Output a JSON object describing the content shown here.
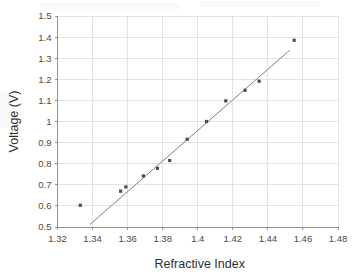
{
  "chart_data": {
    "type": "scatter",
    "title": "",
    "xlabel": "Refractive Index",
    "ylabel": "Voltage (V)",
    "xlim": [
      1.32,
      1.48
    ],
    "ylim": [
      0.5,
      1.5
    ],
    "xticks": [
      "1.32",
      "1.34",
      "1.36",
      "1.38",
      "1.4",
      "1.42",
      "1.44",
      "1.46",
      "1.48"
    ],
    "xtick_values": [
      1.32,
      1.34,
      1.36,
      1.38,
      1.4,
      1.42,
      1.44,
      1.46,
      1.48
    ],
    "yticks": [
      "0.5",
      "0.6",
      "0.7",
      "0.8",
      "0.9",
      "1",
      "1.1",
      "1.2",
      "1.3",
      "1.4",
      "1.5"
    ],
    "ytick_values": [
      0.5,
      0.6,
      0.7,
      0.8,
      0.9,
      1.0,
      1.1,
      1.2,
      1.3,
      1.4,
      1.5
    ],
    "grid": true,
    "legend": false,
    "legend_position": "none",
    "marker_color": "#4a4a5e",
    "trendline_color": "#6f6f83",
    "x": [
      1.333,
      1.356,
      1.359,
      1.369,
      1.377,
      1.384,
      1.394,
      1.405,
      1.416,
      1.427,
      1.435,
      1.455
    ],
    "y": [
      0.603,
      0.67,
      0.69,
      0.742,
      0.778,
      0.815,
      0.916,
      1.0,
      1.098,
      1.148,
      1.191,
      1.385
    ],
    "series": [
      {
        "name": "Voltage vs Refractive Index",
        "points": [
          {
            "x": 1.333,
            "y": 0.603
          },
          {
            "x": 1.356,
            "y": 0.67
          },
          {
            "x": 1.359,
            "y": 0.69
          },
          {
            "x": 1.369,
            "y": 0.742
          },
          {
            "x": 1.377,
            "y": 0.778
          },
          {
            "x": 1.384,
            "y": 0.815
          },
          {
            "x": 1.394,
            "y": 0.916
          },
          {
            "x": 1.405,
            "y": 1.0
          },
          {
            "x": 1.416,
            "y": 1.098
          },
          {
            "x": 1.427,
            "y": 1.148
          },
          {
            "x": 1.435,
            "y": 1.191
          },
          {
            "x": 1.455,
            "y": 1.385
          }
        ]
      }
    ],
    "trendline": {
      "x_start": 1.3385,
      "y_start": 0.512,
      "x_end": 1.4525,
      "y_end": 1.338
    }
  }
}
